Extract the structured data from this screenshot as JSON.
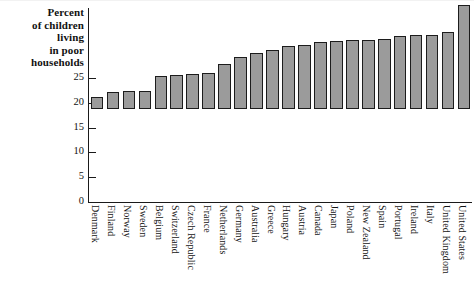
{
  "chart_data": {
    "type": "bar",
    "title": "",
    "ylabel": "Percent of children living in poor households",
    "xlabel": "",
    "ylim": [
      0,
      27
    ],
    "yticks": [
      0,
      5,
      10,
      15,
      20,
      25
    ],
    "grid": false,
    "legend": null,
    "orientation": "vertical",
    "bar_color": "#9b9b9b",
    "bar_edge_color": "#1c1c1c",
    "categories": [
      "Denmark",
      "Finland",
      "Norway",
      "Sweden",
      "Belgium",
      "Switzerland",
      "Czech Republic",
      "France",
      "Netherlands",
      "Germany",
      "Australia",
      "Greece",
      "Hungary",
      "Austria",
      "Canada",
      "Japan",
      "Poland",
      "New Zealand",
      "Spain",
      "Portugal",
      "Ireland",
      "Italy",
      "United Kingdom",
      "United States"
    ],
    "values": [
      2.4,
      3.4,
      3.6,
      3.7,
      6.7,
      6.8,
      7.0,
      7.2,
      9.0,
      10.5,
      11.2,
      11.8,
      12.8,
      12.9,
      13.5,
      13.8,
      14.0,
      14.0,
      14.2,
      14.8,
      15.0,
      15.0,
      15.5,
      21.0
    ]
  },
  "axis_title_lines": [
    "Percent",
    "of children",
    "living",
    "in poor",
    "households"
  ]
}
